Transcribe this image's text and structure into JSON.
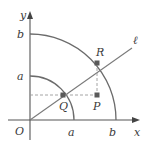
{
  "figure": {
    "axes": {
      "x_label": "x",
      "y_label": "y",
      "origin_label": "O"
    },
    "ticks": {
      "x": [
        {
          "label": "a"
        },
        {
          "label": "b"
        }
      ],
      "y": [
        {
          "label": "a"
        },
        {
          "label": "b"
        }
      ]
    },
    "circles": [
      {
        "name": "inner quarter circle",
        "radius_label": "a"
      },
      {
        "name": "outer quarter circle",
        "radius_label": "b"
      }
    ],
    "line": {
      "label": "ℓ"
    },
    "points": [
      {
        "label": "R"
      },
      {
        "label": "Q"
      },
      {
        "label": "P"
      }
    ],
    "colors": {
      "axis": "#555555",
      "arc": "#6b6b6b",
      "point": "#5a5a5a",
      "text": "#3a3a3a"
    }
  }
}
